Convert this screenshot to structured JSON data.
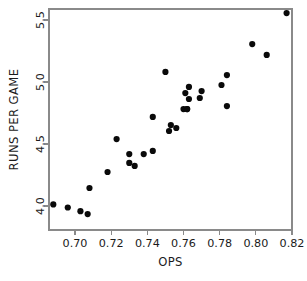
{
  "chart_data": {
    "type": "scatter",
    "title": "",
    "xlabel": "OPS",
    "ylabel": "RUNS PER GAME",
    "xlim": [
      0.685,
      0.822
    ],
    "ylim": [
      3.88,
      5.62
    ],
    "grid": false,
    "legend": null,
    "x_ticks": [
      0.7,
      0.72,
      0.74,
      0.76,
      0.78,
      0.8,
      0.82
    ],
    "x_tick_labels": [
      "0.70",
      "0.72",
      "0.74",
      "0.76",
      "0.78",
      "0.80",
      "0.82"
    ],
    "y_ticks": [
      4.0,
      4.5,
      5.0,
      5.5
    ],
    "y_tick_labels": [
      "4.0",
      "4.5",
      "5.0",
      "5.5"
    ],
    "marker": "filled-circle",
    "marker_color": "#0a0a0a",
    "marker_size": 3.1,
    "points": [
      {
        "x": 0.688,
        "y": 4.013
      },
      {
        "x": 0.696,
        "y": 3.988
      },
      {
        "x": 0.703,
        "y": 3.958
      },
      {
        "x": 0.707,
        "y": 3.935
      },
      {
        "x": 0.708,
        "y": 4.145
      },
      {
        "x": 0.718,
        "y": 4.274
      },
      {
        "x": 0.723,
        "y": 4.54
      },
      {
        "x": 0.73,
        "y": 4.419
      },
      {
        "x": 0.73,
        "y": 4.347
      },
      {
        "x": 0.733,
        "y": 4.323
      },
      {
        "x": 0.738,
        "y": 4.419
      },
      {
        "x": 0.743,
        "y": 4.444
      },
      {
        "x": 0.743,
        "y": 4.718
      },
      {
        "x": 0.75,
        "y": 5.081
      },
      {
        "x": 0.752,
        "y": 4.605
      },
      {
        "x": 0.753,
        "y": 4.653
      },
      {
        "x": 0.756,
        "y": 4.629
      },
      {
        "x": 0.76,
        "y": 4.782
      },
      {
        "x": 0.761,
        "y": 4.911
      },
      {
        "x": 0.762,
        "y": 4.782
      },
      {
        "x": 0.762,
        "y": 4.782
      },
      {
        "x": 0.763,
        "y": 4.96
      },
      {
        "x": 0.763,
        "y": 4.863
      },
      {
        "x": 0.769,
        "y": 4.871
      },
      {
        "x": 0.77,
        "y": 4.927
      },
      {
        "x": 0.781,
        "y": 4.976
      },
      {
        "x": 0.784,
        "y": 5.056
      },
      {
        "x": 0.784,
        "y": 4.806
      },
      {
        "x": 0.798,
        "y": 5.306
      },
      {
        "x": 0.806,
        "y": 5.218
      },
      {
        "x": 0.817,
        "y": 5.556
      }
    ]
  },
  "axes": {
    "x_axis_name": "OPS",
    "y_axis_name": "RUNS PER GAME"
  }
}
